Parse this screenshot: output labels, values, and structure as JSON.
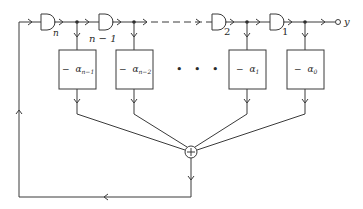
{
  "diagram": {
    "type": "shift-register feedback block diagram",
    "output_label": "y",
    "delay_elements": [
      {
        "label": "n"
      },
      {
        "label": "n − 1"
      },
      {
        "label": "2"
      },
      {
        "label": "1"
      }
    ],
    "coefficient_blocks": [
      {
        "sign": "−",
        "symbol": "α",
        "subscript": "n−1"
      },
      {
        "sign": "−",
        "symbol": "α",
        "subscript": "n−2"
      },
      {
        "sign": "−",
        "symbol": "α",
        "subscript": "1"
      },
      {
        "sign": "−",
        "symbol": "α",
        "subscript": "0"
      }
    ],
    "ellipsis": "• • •",
    "summing_junction_symbol": "+",
    "colors": {
      "stroke": "#3a3a3a",
      "text": "#2a2a2a",
      "background": "#ffffff"
    }
  }
}
